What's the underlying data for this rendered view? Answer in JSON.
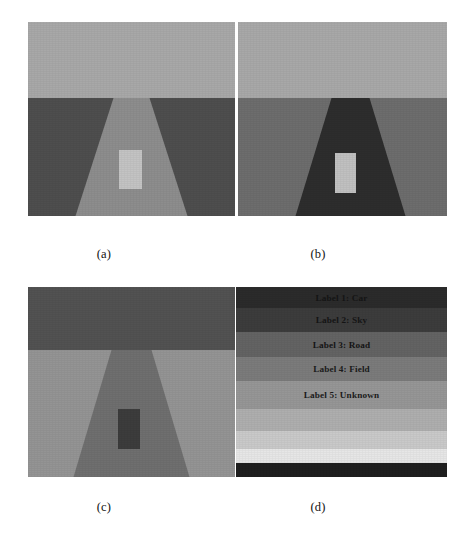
{
  "figure": {
    "background": "#ffffff",
    "panels": [
      {
        "id": "a",
        "caption": "(a)",
        "x": 28,
        "y": 22,
        "width": 207,
        "height": 194,
        "sky_color": "#a8a8a8",
        "sky_height": 76,
        "field_color": "#4e4e4e",
        "road_color": "#8d8d8d",
        "road_top_half_width": 18,
        "road_bottom_half_width": 56,
        "road_center_offset": 0,
        "car_color": "#c3c3c3",
        "car_x": 91,
        "car_y": 128,
        "car_w": 23,
        "car_h": 39
      },
      {
        "id": "b",
        "caption": "(b)",
        "x": 238,
        "y": 22,
        "width": 209,
        "height": 194,
        "sky_color": "#a8a8a8",
        "sky_height": 76,
        "field_color": "#6d6d6d",
        "road_color": "#2d2d2d",
        "road_top_half_width": 19,
        "road_bottom_half_width": 55,
        "road_center_offset": 8,
        "car_color": "#c0c0c0",
        "car_x": 97,
        "car_y": 131,
        "car_w": 21,
        "car_h": 40
      },
      {
        "id": "c",
        "caption": "(c)",
        "x": 28,
        "y": 287,
        "width": 207,
        "height": 190,
        "sky_color": "#525252",
        "sky_height": 63,
        "field_color": "#949494",
        "road_color": "#6f6f6f",
        "road_top_half_width": 20,
        "road_bottom_half_width": 58,
        "road_center_offset": 0,
        "car_color": "#3c3c3c",
        "car_x": 90,
        "car_y": 122,
        "car_w": 22,
        "car_h": 40
      }
    ],
    "legend_panel": {
      "id": "d",
      "caption": "(d)",
      "x": 236,
      "y": 287,
      "width": 211,
      "height": 190,
      "bands": [
        {
          "label": "Label 1: Car",
          "color": "#2b2b2b",
          "height": 21,
          "text_on_dark": true
        },
        {
          "label": "Label 2: Sky",
          "color": "#3c3c3c",
          "height": 24,
          "text_on_dark": true
        },
        {
          "label": "Label 3: Road",
          "color": "#636363",
          "height": 25,
          "text_on_dark": true
        },
        {
          "label": "Label 4: Field",
          "color": "#7b7b7b",
          "height": 24,
          "text_on_dark": false
        },
        {
          "label": "Label 5: Unknown",
          "color": "#969696",
          "height": 28,
          "text_on_dark": false
        },
        {
          "label": "",
          "color": "#aeaeae",
          "height": 22,
          "text_on_dark": false
        },
        {
          "label": "",
          "color": "#c9c9c9",
          "height": 18,
          "text_on_dark": false
        },
        {
          "label": "",
          "color": "#e6e6e6",
          "height": 14,
          "text_on_dark": false
        },
        {
          "label": "",
          "color": "#1f1f1f",
          "height": 14,
          "text_on_dark": true
        }
      ]
    },
    "captions": {
      "a": {
        "text": "(a)",
        "x": 104,
        "y": 247
      },
      "b": {
        "text": "(b)",
        "x": 318,
        "y": 247
      },
      "c": {
        "text": "(c)",
        "x": 104,
        "y": 500
      },
      "d": {
        "text": "(d)",
        "x": 318,
        "y": 500
      }
    }
  }
}
